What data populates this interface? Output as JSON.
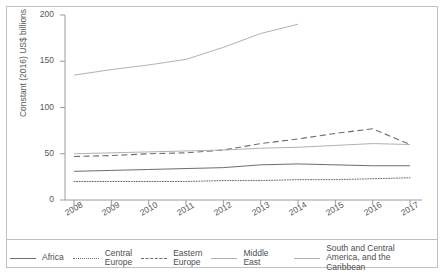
{
  "chart_data": {
    "type": "line",
    "title": "",
    "xlabel": "",
    "ylabel": "Constant (2016) US$ billions",
    "categories": [
      "2008",
      "2009",
      "2010",
      "2011",
      "2012",
      "2013",
      "2014",
      "2015",
      "2016",
      "2017"
    ],
    "ylim": [
      0,
      200
    ],
    "yticks": [
      0,
      50,
      100,
      150,
      200
    ],
    "grid": false,
    "legend_position": "bottom",
    "series": [
      {
        "name": "Africa",
        "style": "solid",
        "color": "#6d6e70",
        "values": [
          31,
          32,
          33,
          34,
          35,
          38,
          39,
          38,
          37,
          37
        ]
      },
      {
        "name": "Central Europe",
        "style": "dotted",
        "color": "#6d6e70",
        "values": [
          20,
          20,
          20,
          20,
          21,
          21,
          22,
          22,
          23,
          24
        ]
      },
      {
        "name": "Eastern Europe",
        "style": "dashed",
        "color": "#6d6e70",
        "values": [
          47,
          48,
          50,
          51,
          54,
          61,
          66,
          72,
          77,
          60
        ]
      },
      {
        "name": "Middle East",
        "style": "solid",
        "color": "#b0b2b4",
        "values": [
          135,
          141,
          146,
          152,
          165,
          180,
          190,
          null,
          null,
          null
        ]
      },
      {
        "name": "South and Central America, and the Caribbean",
        "style": "solid",
        "color": "#b0b2b4",
        "values": [
          50,
          51,
          52,
          53,
          54,
          56,
          57,
          59,
          61,
          60
        ]
      }
    ]
  },
  "legend": {
    "items": [
      {
        "label": "Africa",
        "icon": "solid-line-icon"
      },
      {
        "label": "Central\nEurope",
        "icon": "dotted-line-icon"
      },
      {
        "label": "Eastern\nEurope",
        "icon": "dashed-line-icon"
      },
      {
        "label": "Middle East",
        "icon": "solid-line-light-icon"
      },
      {
        "label": "South and Central\nAmerica, and the Caribbean",
        "icon": "solid-line-light-icon"
      }
    ]
  }
}
